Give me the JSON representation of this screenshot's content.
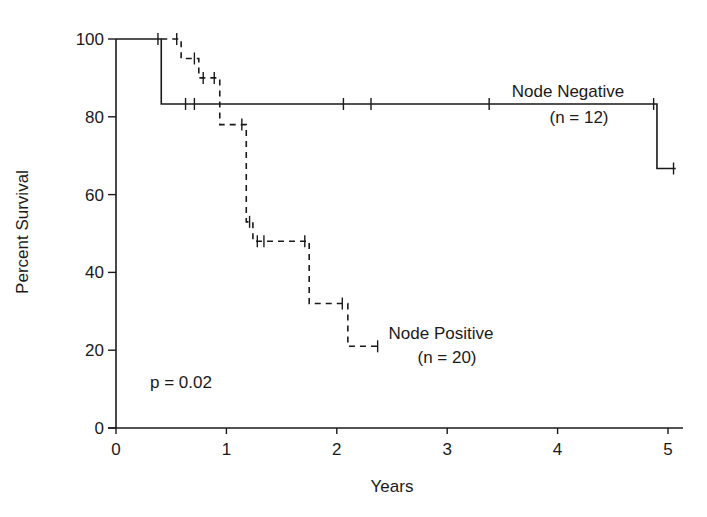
{
  "chart_data": {
    "type": "line",
    "subtype": "kaplan-meier step survival curve",
    "title": "",
    "xlabel": "Years",
    "ylabel": "Percent Survival",
    "xlim": [
      0,
      5.1
    ],
    "ylim": [
      0,
      100
    ],
    "xticks": [
      0,
      1,
      2,
      3,
      4,
      5
    ],
    "yticks": [
      0,
      20,
      40,
      60,
      80,
      100
    ],
    "grid": false,
    "legend": "inline labels",
    "annotations": [
      {
        "text": "p = 0.02",
        "x": 0.5,
        "y": 17
      }
    ],
    "series": [
      {
        "name": "Node Negative",
        "n_label": "(n = 12)",
        "style": "solid",
        "steps": [
          [
            0,
            100
          ],
          [
            0.41,
            83.3
          ],
          [
            4.9,
            66.7
          ]
        ],
        "end_x": 5.07,
        "censored": [
          [
            0.38,
            100
          ],
          [
            0.63,
            83.3
          ],
          [
            0.71,
            83.3
          ],
          [
            2.06,
            83.3
          ],
          [
            2.31,
            83.3
          ],
          [
            3.38,
            83.3
          ],
          [
            4.87,
            83.3
          ],
          [
            5.05,
            66.7
          ]
        ],
        "label_pos": {
          "x": 4.0,
          "y": 87
        }
      },
      {
        "name": "Node Positive",
        "n_label": "(n = 20)",
        "style": "dashed",
        "steps": [
          [
            0.41,
            100
          ],
          [
            0.59,
            95
          ],
          [
            0.75,
            90
          ],
          [
            0.94,
            78
          ],
          [
            1.18,
            53
          ],
          [
            1.24,
            48
          ],
          [
            1.75,
            32
          ],
          [
            2.1,
            21
          ]
        ],
        "end_x": 2.37,
        "censored": [
          [
            0.55,
            100
          ],
          [
            0.71,
            95
          ],
          [
            0.79,
            90
          ],
          [
            0.89,
            90
          ],
          [
            1.14,
            78
          ],
          [
            1.21,
            53
          ],
          [
            1.28,
            48
          ],
          [
            1.34,
            48
          ],
          [
            1.71,
            48
          ],
          [
            2.05,
            32
          ],
          [
            2.37,
            21
          ]
        ],
        "label_pos": {
          "x": 2.95,
          "y": 22
        }
      }
    ]
  },
  "labels": {
    "xlabel": "Years",
    "ylabel": "Percent Survival",
    "p_value": "p = 0.02",
    "neg_name": "Node Negative",
    "neg_n": "(n = 12)",
    "pos_name": "Node Positive",
    "pos_n": "(n = 20)"
  },
  "colors": {
    "line": "#1a1a1a",
    "background": "#ffffff"
  }
}
